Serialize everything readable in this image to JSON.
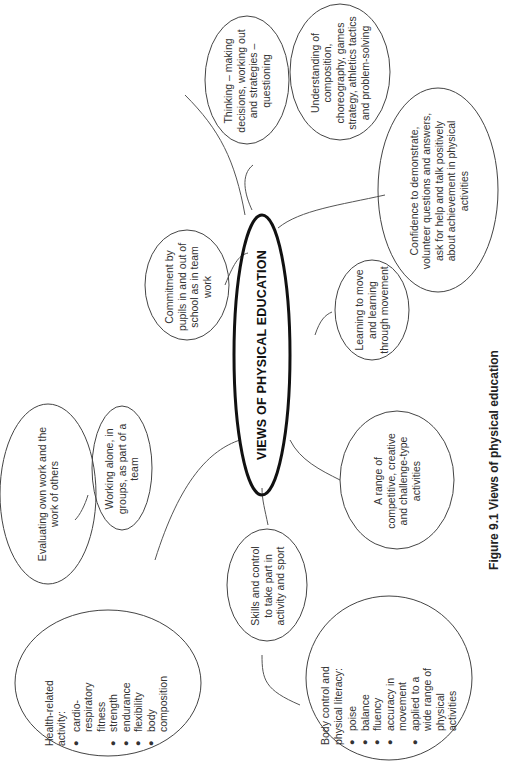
{
  "diagram": {
    "center": {
      "label": "VIEWS OF PHYSICAL EDUCATION"
    },
    "nodes": [
      {
        "id": "thinking",
        "text": "Thinking – making decisions, working out and strategies – questioning"
      },
      {
        "id": "understanding",
        "text": "Understanding of composition, choreography, games strategy, athletics tactics and problem-solving"
      },
      {
        "id": "confidence",
        "text": "Confidence to demonstrate, volunteer questions and answers, ask for help and talk positively about achievement in physical activities"
      },
      {
        "id": "commitment",
        "text": "Commitment by pupils in and out of school as in team work"
      },
      {
        "id": "learning",
        "text": "Learning to move and learning through movement"
      },
      {
        "id": "evaluating",
        "text": "Evaluating own work and the work of others"
      },
      {
        "id": "working",
        "text": "Working alone, in groups, as part of a team"
      },
      {
        "id": "range",
        "text": "A range of competitive, creative and challenge-type activities"
      },
      {
        "id": "skills",
        "text": "Skills and control to take part in activity and sport"
      },
      {
        "id": "health",
        "heading": "Health-related activity:",
        "items": [
          "cardio-respiratory fitness",
          "strength",
          "endurance",
          "flexibility",
          "body composition"
        ]
      },
      {
        "id": "body",
        "heading": "Body control and physical literacy:",
        "items": [
          "poise",
          "balance",
          "fluency",
          "accuracy in movement",
          "applied to a wide range of physical activities"
        ]
      }
    ],
    "caption": "Figure 9.1 Views of physical education"
  }
}
